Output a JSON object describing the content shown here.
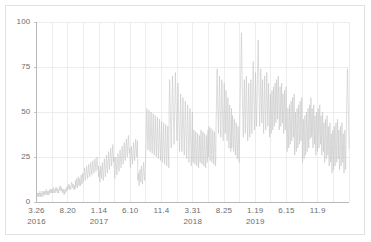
{
  "chart_data": {
    "type": "line",
    "title": "",
    "subtitle": "",
    "xlabel": "",
    "ylabel": "",
    "ylim": [
      0,
      100
    ],
    "yticks": [
      0,
      25,
      50,
      75,
      100
    ],
    "ytick_labels": [
      "0",
      "25",
      "50",
      "75",
      "100"
    ],
    "grid": true,
    "grid_axes": "both",
    "legend": null,
    "legend_position": "none",
    "series_color": "#c2c2c2",
    "grid_color": "#e8e8e8",
    "axis_color": "#b9b9b9",
    "frame_color": "#e2e2e2",
    "tick_text_color": "#6d6d6d",
    "background": "#ffffff",
    "xtick_labels": [
      "3.26",
      "8.20",
      "1.14",
      "6.10",
      "11.4",
      "3.31",
      "8.25",
      "1.19",
      "6.15",
      "11.9"
    ],
    "xtick_year_labels": [
      {
        "index": 0,
        "text": "2016"
      },
      {
        "index": 2,
        "text": "2017"
      },
      {
        "index": 5,
        "text": "2018"
      },
      {
        "index": 7,
        "text": "2019"
      }
    ],
    "x_minor_gridline_count": 20,
    "x_range_start": "3.26.2016",
    "x_range_end": "2020",
    "regimes": [
      {
        "label": "baseline-low",
        "x_start": 0.0,
        "x_end": 0.135,
        "mean": 4,
        "spread": 3
      },
      {
        "label": "slow-rise",
        "x_start": 0.135,
        "x_end": 0.24,
        "mean": 8,
        "spread": 6
      },
      {
        "label": "mid-band",
        "x_start": 0.24,
        "x_end": 0.41,
        "mean": 17,
        "spread": 12
      },
      {
        "label": "step-up-2017-11",
        "x_start": 0.41,
        "x_end": 0.63,
        "mean": 33,
        "spread": 22
      },
      {
        "label": "plateau-2018",
        "x_start": 0.63,
        "x_end": 0.76,
        "mean": 30,
        "spread": 20
      },
      {
        "label": "high-2019",
        "x_start": 0.76,
        "x_end": 0.93,
        "mean": 44,
        "spread": 28
      },
      {
        "label": "late-2019",
        "x_start": 0.93,
        "x_end": 1.0,
        "mean": 33,
        "spread": 22
      }
    ],
    "values": [
      3,
      4,
      3,
      4,
      5,
      4,
      3,
      4,
      5,
      4,
      3,
      4,
      5,
      6,
      4,
      3,
      4,
      5,
      4,
      3,
      4,
      5,
      6,
      5,
      4,
      3,
      4,
      5,
      6,
      5,
      4,
      5,
      6,
      5,
      4,
      5,
      6,
      7,
      6,
      5,
      4,
      5,
      6,
      5,
      4,
      5,
      6,
      5,
      4,
      5,
      6,
      7,
      6,
      5,
      6,
      7,
      6,
      5,
      6,
      7,
      6,
      5,
      6,
      7,
      8,
      7,
      6,
      5,
      6,
      7,
      6,
      5,
      6,
      7,
      8,
      7,
      6,
      7,
      8,
      7,
      6,
      5,
      6,
      7,
      6,
      5,
      6,
      7,
      8,
      7,
      8,
      9,
      8,
      7,
      6,
      7,
      8,
      7,
      6,
      7,
      6,
      5,
      6,
      7,
      6,
      5,
      4,
      5,
      6,
      7,
      6,
      5,
      6,
      7,
      8,
      7,
      6,
      7,
      8,
      9,
      8,
      7,
      8,
      9,
      10,
      9,
      8,
      7,
      8,
      9,
      8,
      7,
      8,
      9,
      10,
      11,
      10,
      9,
      8,
      9,
      10,
      9,
      8,
      7,
      8,
      9,
      8,
      7,
      9,
      12,
      10,
      8,
      9,
      11,
      13,
      11,
      9,
      8,
      10,
      12,
      14,
      12,
      10,
      9,
      11,
      13,
      12,
      10,
      9,
      11,
      13,
      15,
      13,
      11,
      10,
      12,
      14,
      16,
      14,
      12,
      11,
      13,
      15,
      17,
      19,
      17,
      15,
      13,
      12,
      14,
      16,
      18,
      20,
      18,
      16,
      14,
      13,
      15,
      17,
      19,
      21,
      19,
      17,
      15,
      14,
      16,
      18,
      20,
      22,
      20,
      18,
      16,
      15,
      17,
      19,
      21,
      23,
      21,
      19,
      17,
      16,
      18,
      20,
      22,
      24,
      22,
      20,
      18,
      17,
      19,
      21,
      23,
      25,
      23,
      21,
      19,
      18,
      20,
      14,
      16,
      18,
      15,
      13,
      11,
      14,
      17,
      20,
      18,
      15,
      13,
      16,
      19,
      22,
      20,
      17,
      14,
      12,
      15,
      18,
      21,
      24,
      22,
      19,
      16,
      14,
      17,
      20,
      23,
      26,
      24,
      21,
      18,
      16,
      19,
      22,
      25,
      28,
      26,
      23,
      20,
      18,
      21,
      24,
      27,
      30,
      28,
      25,
      22,
      20,
      23,
      26,
      29,
      32,
      30,
      27,
      24,
      22,
      25,
      18,
      15,
      13,
      16,
      19,
      22,
      25,
      23,
      20,
      17,
      15,
      18,
      21,
      24,
      27,
      25,
      22,
      19,
      17,
      20,
      23,
      26,
      29,
      27,
      24,
      21,
      19,
      22,
      25,
      28,
      31,
      29,
      26,
      23,
      21,
      24,
      27,
      30,
      33,
      31,
      28,
      25,
      23,
      26,
      29,
      32,
      35,
      33,
      30,
      27,
      25,
      28,
      31,
      34,
      37,
      35,
      32,
      29,
      27,
      30,
      24,
      21,
      19,
      22,
      25,
      28,
      31,
      29,
      26,
      23,
      21,
      24,
      27,
      30,
      33,
      31,
      28,
      25,
      23,
      26,
      29,
      32,
      35,
      33,
      30,
      27,
      25,
      28,
      31,
      34,
      12,
      14,
      16,
      13,
      11,
      9,
      12,
      15,
      18,
      16,
      13,
      11,
      14,
      17,
      20,
      18,
      15,
      12,
      10,
      13,
      16,
      19,
      22,
      20,
      17,
      14,
      12,
      15,
      18,
      21,
      25,
      30,
      35,
      42,
      48,
      52,
      45,
      38,
      33,
      29,
      35,
      41,
      47,
      51,
      44,
      37,
      32,
      28,
      34,
      40,
      46,
      50,
      43,
      36,
      31,
      27,
      33,
      39,
      45,
      49,
      42,
      35,
      30,
      26,
      32,
      38,
      44,
      48,
      41,
      34,
      29,
      25,
      31,
      37,
      43,
      47,
      40,
      33,
      28,
      24,
      30,
      36,
      42,
      46,
      39,
      32,
      27,
      23,
      29,
      35,
      41,
      45,
      38,
      31,
      26,
      22,
      28,
      34,
      40,
      44,
      37,
      30,
      25,
      21,
      27,
      33,
      39,
      43,
      36,
      29,
      24,
      20,
      26,
      32,
      38,
      42,
      35,
      28,
      23,
      19,
      52,
      60,
      68,
      62,
      55,
      48,
      42,
      36,
      30,
      38,
      46,
      54,
      62,
      70,
      64,
      57,
      50,
      44,
      38,
      32,
      40,
      48,
      56,
      64,
      72,
      66,
      59,
      52,
      46,
      40,
      34,
      42,
      50,
      58,
      66,
      60,
      53,
      46,
      40,
      34,
      28,
      36,
      44,
      52,
      60,
      54,
      47,
      40,
      34,
      28,
      36,
      44,
      52,
      58,
      51,
      44,
      38,
      32,
      26,
      34,
      42,
      50,
      56,
      49,
      42,
      36,
      30,
      24,
      32,
      40,
      48,
      54,
      47,
      40,
      34,
      28,
      22,
      30,
      38,
      46,
      52,
      45,
      38,
      32,
      26,
      20,
      28,
      36,
      44,
      50,
      30,
      26,
      22,
      28,
      34,
      40,
      36,
      30,
      25,
      21,
      27,
      33,
      39,
      35,
      29,
      24,
      20,
      26,
      32,
      38,
      34,
      28,
      23,
      19,
      25,
      31,
      37,
      33,
      27,
      22,
      28,
      34,
      40,
      36,
      30,
      25,
      21,
      27,
      33,
      39,
      35,
      29,
      24,
      20,
      26,
      32,
      38,
      34,
      28,
      23,
      19,
      25,
      31,
      37,
      33,
      27,
      22,
      28,
      34,
      40,
      25,
      30,
      36,
      42,
      38,
      32,
      27,
      23,
      29,
      35,
      41,
      37,
      31,
      26,
      22,
      28,
      34,
      40,
      36,
      30,
      25,
      21,
      27,
      33,
      39,
      35,
      29,
      24,
      20,
      26,
      45,
      52,
      60,
      68,
      74,
      66,
      58,
      50,
      44,
      38,
      46,
      54,
      62,
      70,
      64,
      56,
      48,
      42,
      36,
      44,
      52,
      60,
      68,
      62,
      54,
      46,
      40,
      34,
      42,
      50,
      58,
      66,
      60,
      52,
      44,
      38,
      46,
      54,
      62,
      56,
      48,
      40,
      34,
      42,
      50,
      58,
      52,
      44,
      36,
      30,
      38,
      46,
      54,
      48,
      40,
      34,
      28,
      36,
      44,
      52,
      30,
      36,
      42,
      48,
      44,
      38,
      32,
      28,
      34,
      40,
      46,
      42,
      36,
      30,
      26,
      32,
      38,
      44,
      40,
      34,
      28,
      24,
      30,
      36,
      42,
      38,
      32,
      26,
      22,
      28,
      38,
      46,
      54,
      62,
      70,
      78,
      86,
      94,
      86,
      76,
      66,
      58,
      50,
      42,
      36,
      44,
      52,
      60,
      68,
      60,
      52,
      44,
      38,
      46,
      54,
      62,
      70,
      62,
      54,
      46,
      40,
      34,
      42,
      50,
      58,
      66,
      58,
      50,
      42,
      36,
      44,
      52,
      60,
      68,
      60,
      52,
      44,
      38,
      46,
      54,
      62,
      70,
      78,
      70,
      62,
      54,
      46,
      40,
      48,
      56,
      64,
      72,
      64,
      56,
      48,
      42,
      50,
      58,
      66,
      74,
      82,
      90,
      82,
      72,
      64,
      56,
      48,
      42,
      50,
      58,
      66,
      74,
      66,
      58,
      50,
      44,
      52,
      60,
      68,
      60,
      52,
      44,
      38,
      46,
      54,
      62,
      70,
      62,
      54,
      46,
      40,
      48,
      56,
      64,
      72,
      64,
      56,
      48,
      42,
      50,
      58,
      66,
      58,
      50,
      42,
      36,
      44,
      52,
      60,
      52,
      44,
      38,
      46,
      54,
      62,
      54,
      46,
      40,
      48,
      56,
      64,
      56,
      48,
      42,
      50,
      58,
      66,
      58,
      50,
      44,
      52,
      60,
      68,
      60,
      52,
      46,
      54,
      62,
      70,
      62,
      54,
      46,
      40,
      48,
      56,
      64,
      56,
      48,
      42,
      50,
      58,
      66,
      58,
      50,
      44,
      52,
      60,
      52,
      44,
      38,
      46,
      54,
      62,
      54,
      46,
      40,
      48,
      56,
      64,
      56,
      40,
      34,
      28,
      36,
      44,
      52,
      44,
      36,
      30,
      38,
      46,
      54,
      46,
      38,
      32,
      40,
      48,
      56,
      48,
      40,
      34,
      42,
      50,
      58,
      50,
      42,
      36,
      44,
      52,
      60,
      30,
      26,
      34,
      42,
      50,
      42,
      34,
      28,
      36,
      44,
      52,
      44,
      36,
      30,
      38,
      46,
      54,
      46,
      38,
      32,
      40,
      48,
      56,
      48,
      40,
      34,
      42,
      50,
      58,
      50,
      26,
      22,
      30,
      38,
      46,
      38,
      30,
      24,
      32,
      40,
      48,
      40,
      32,
      26,
      34,
      42,
      50,
      42,
      34,
      28,
      36,
      44,
      52,
      44,
      36,
      30,
      38,
      46,
      54,
      46,
      35,
      42,
      50,
      58,
      50,
      42,
      36,
      44,
      52,
      44,
      36,
      30,
      38,
      46,
      54,
      46,
      38,
      32,
      40,
      48,
      40,
      32,
      26,
      34,
      42,
      50,
      42,
      34,
      28,
      36,
      44,
      52,
      44,
      36,
      30,
      38,
      46,
      54,
      46,
      38,
      32,
      40,
      48,
      40,
      32,
      26,
      34,
      42,
      50,
      42,
      34,
      28,
      36,
      44,
      36,
      28,
      22,
      30,
      38,
      46,
      38,
      30,
      24,
      32,
      40,
      48,
      40,
      32,
      26,
      34,
      42,
      34,
      26,
      20,
      28,
      36,
      44,
      36,
      28,
      22,
      30,
      38,
      30,
      22,
      16,
      24,
      32,
      40,
      32,
      24,
      18,
      26,
      34,
      42,
      34,
      26,
      20,
      28,
      36,
      44,
      36,
      28,
      22,
      30,
      38,
      46,
      38,
      30,
      24,
      32,
      40,
      32,
      24,
      18,
      26,
      34,
      42,
      34,
      26,
      20,
      28,
      36,
      44,
      36,
      28,
      22,
      30,
      38,
      30,
      22,
      16,
      24,
      32,
      40,
      32,
      24,
      18,
      26,
      34,
      42,
      50,
      58,
      66,
      74,
      70,
      62,
      54,
      46,
      38,
      30
    ]
  }
}
